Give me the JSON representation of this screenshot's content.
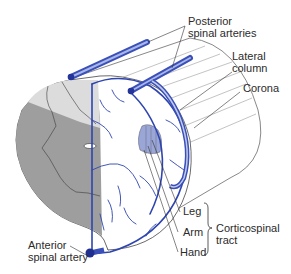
{
  "diagram": {
    "colors": {
      "artery_blue": "#3a50b8",
      "artery_light": "#8ea0dc",
      "white_matter_light": "#e6e6e6",
      "gray_matter_dark": "#9a9a9a",
      "tract_shade": "#8f9bd0",
      "outline": "#444444",
      "text": "#2b2b2b"
    },
    "labels": {
      "posterior_spinal_arteries": [
        "Posterior",
        "spinal arteries"
      ],
      "lateral_column": [
        "Lateral",
        "column"
      ],
      "corona": "Corona",
      "leg": "Leg",
      "arm": "Arm",
      "hand": "Hand",
      "corticospinal_tract": [
        "Corticospinal",
        "tract"
      ],
      "anterior_spinal_artery": [
        "Anterior",
        "spinal artery"
      ]
    }
  }
}
